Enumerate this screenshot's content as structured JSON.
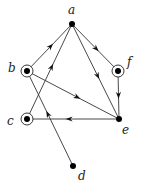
{
  "diagram": {
    "type": "directed-graph",
    "nodes": [
      {
        "id": "a",
        "label": "a",
        "x": 72,
        "y": 24,
        "circled": false,
        "lx": 68,
        "ly": 14
      },
      {
        "id": "b",
        "label": "b",
        "x": 27,
        "y": 71,
        "circled": true,
        "lx": 8,
        "ly": 72
      },
      {
        "id": "f",
        "label": "f",
        "x": 118,
        "y": 71,
        "circled": true,
        "lx": 127,
        "ly": 66
      },
      {
        "id": "c",
        "label": "c",
        "x": 27,
        "y": 119,
        "circled": true,
        "lx": 7,
        "ly": 125
      },
      {
        "id": "e",
        "label": "e",
        "x": 119,
        "y": 119,
        "circled": false,
        "lx": 122,
        "ly": 134
      },
      {
        "id": "d",
        "label": "d",
        "x": 73,
        "y": 166,
        "circled": false,
        "lx": 78,
        "ly": 180
      }
    ],
    "edges": [
      {
        "from": "b",
        "to": "a"
      },
      {
        "from": "c",
        "to": "a"
      },
      {
        "from": "a",
        "to": "e"
      },
      {
        "from": "a",
        "to": "f"
      },
      {
        "from": "f",
        "to": "e"
      },
      {
        "from": "b",
        "to": "e"
      },
      {
        "from": "e",
        "to": "c"
      },
      {
        "from": "d",
        "to": "b"
      }
    ]
  }
}
